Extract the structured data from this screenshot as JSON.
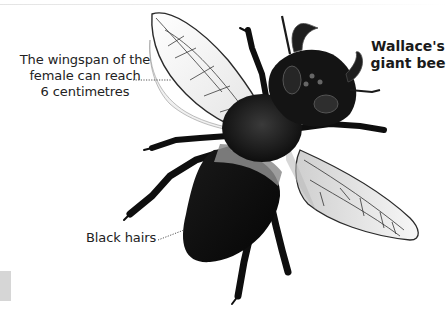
{
  "title": {
    "line1": "Wallace's",
    "line2": "giant bee"
  },
  "labels": {
    "wingspan": {
      "line1": "The wingspan of the",
      "line2": "female can reach",
      "line3": "6 centimetres"
    },
    "hairs": "Black hairs"
  },
  "colors": {
    "text": "#222222",
    "body": "#111111",
    "band": "#8a8a8a",
    "wing_vein": "#3a3a3a",
    "wing_fill": "#f2f2f2",
    "leader": "#555555",
    "side_tab": "#d6d6d6"
  },
  "illustration": {
    "subject": "bee-illustration",
    "parts": [
      "head",
      "mandibles",
      "antennae",
      "thorax",
      "abdomen",
      "forewing-left",
      "forewing-right",
      "legs"
    ]
  }
}
